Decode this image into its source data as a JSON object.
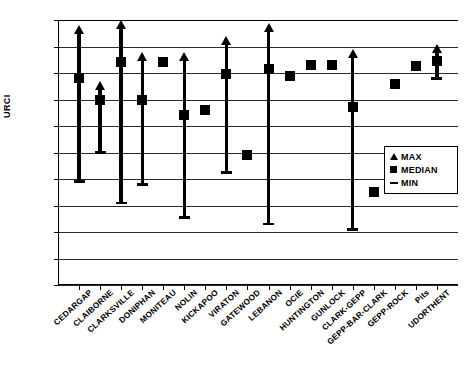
{
  "chart_data": {
    "type": "bar",
    "title": "",
    "xlabel": "",
    "ylabel": "URCI",
    "ylim": [
      0,
      100
    ],
    "ytick_step": 10,
    "yticks": [
      100,
      90,
      80,
      70,
      60,
      50,
      40,
      30,
      20,
      10,
      0
    ],
    "grid": true,
    "legend_position": "inside-right",
    "legend": [
      {
        "key": "max",
        "label": "MAX",
        "marker": "triangle-up"
      },
      {
        "key": "median",
        "label": "MEDIAN",
        "marker": "square"
      },
      {
        "key": "min",
        "label": "MIN",
        "marker": "dash"
      }
    ],
    "categories": [
      "CEDARGAP",
      "CLAIBORNE",
      "CLARKSVILLE",
      "DONIPHAN",
      "MONITEAU",
      "NOLIN",
      "KICKAPOO",
      "VIRATON",
      "GATEWOOD",
      "LEBANON",
      "OCIE",
      "HUNTINGTON",
      "GUNLOCK",
      "CLARK-GEPP",
      "GEPP-BAR-CLARK",
      "GEPP-ROCK",
      "Pits",
      "UDORTHENT"
    ],
    "series": [
      {
        "name": "MAX",
        "values": [
          98,
          77,
          100,
          88,
          null,
          88,
          null,
          94,
          null,
          99,
          null,
          null,
          null,
          89,
          null,
          null,
          null,
          91
        ]
      },
      {
        "name": "MEDIAN",
        "values": [
          78,
          70,
          84,
          70,
          84,
          64,
          66,
          79.5,
          49,
          81.5,
          79,
          83,
          83,
          67,
          35,
          76,
          82.5,
          84.5
        ]
      },
      {
        "name": "MIN",
        "values": [
          39,
          50,
          31,
          38,
          null,
          25.5,
          null,
          42.5,
          null,
          23,
          null,
          null,
          null,
          21,
          null,
          null,
          null,
          78
        ]
      }
    ]
  },
  "axis": {
    "y_title": "URCI"
  }
}
